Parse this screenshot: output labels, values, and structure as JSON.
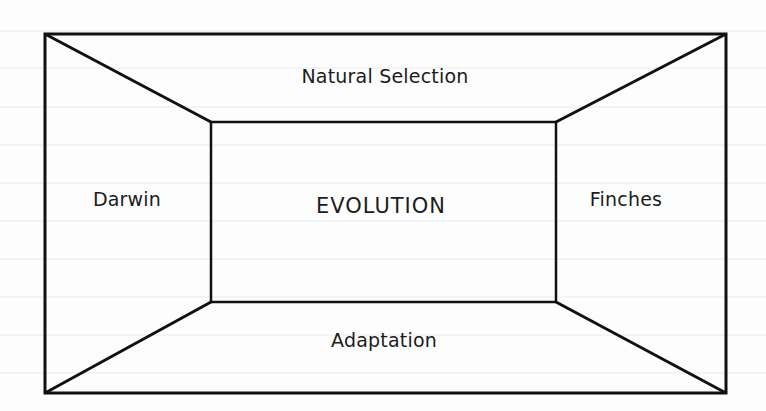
{
  "diagram": {
    "type": "frame-organizer",
    "center": {
      "label": "EVOLUTION"
    },
    "panels": {
      "top": {
        "label": "Natural Selection"
      },
      "left": {
        "label": "Darwin"
      },
      "right": {
        "label": "Finches"
      },
      "bottom": {
        "label": "Adaptation"
      }
    },
    "geometry": {
      "outer_rect": {
        "x1": 45,
        "y1": 34,
        "x2": 726,
        "y2": 393
      },
      "inner_rect": {
        "x1": 211,
        "y1": 122,
        "x2": 556,
        "y2": 302
      }
    },
    "colors": {
      "stroke": "#111111",
      "text": "#1c1c1c",
      "background": "#fdfdfd",
      "rule_lines": "#e6ebef"
    }
  }
}
